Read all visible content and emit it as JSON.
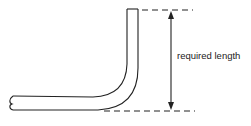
{
  "diagram": {
    "label": "required length",
    "colors": {
      "stroke": "#222222",
      "background": "#ffffff"
    },
    "elements": [
      {
        "type": "bent-pipe",
        "description": "horizontal pipe with broken left end bending 90 degrees upward"
      },
      {
        "type": "dimension-line",
        "description": "double-headed vertical arrow spanning from top of pipe to bottom of bend"
      },
      {
        "type": "extension-line",
        "description": "dashed line at top of vertical pipe"
      },
      {
        "type": "extension-line",
        "description": "dashed line at bottom of bend"
      }
    ]
  }
}
